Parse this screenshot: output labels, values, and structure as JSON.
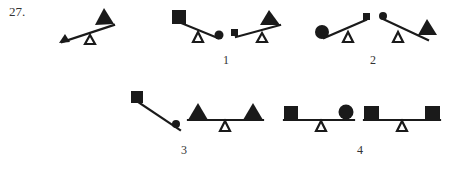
{
  "question": {
    "number": "27.",
    "stem": {
      "description": "Seesaw tilted: small triangle on low left end, large triangle on high right end",
      "left_weight": "small-triangle",
      "right_weight": "large-triangle"
    }
  },
  "options": [
    {
      "label": "1",
      "figures": [
        {
          "left_weight": "large-square",
          "right_weight": "small-circle",
          "tilt": "left-up"
        },
        {
          "left_weight": "small-square",
          "right_weight": "large-triangle",
          "tilt": "right-up"
        }
      ]
    },
    {
      "label": "2",
      "figures": [
        {
          "left_weight": "large-circle",
          "right_weight": "small-square",
          "tilt": "right-up"
        },
        {
          "left_weight": "small-circle",
          "right_weight": "large-triangle",
          "tilt": "left-up"
        }
      ]
    },
    {
      "label": "3",
      "figures": [
        {
          "left_weight": "square",
          "right_weight": "small-circle",
          "tilt": "left-up",
          "fulcrum": "none"
        },
        {
          "left_weight": "large-triangle",
          "right_weight": "large-triangle",
          "tilt": "level"
        }
      ]
    },
    {
      "label": "4",
      "figures": [
        {
          "left_weight": "square",
          "right_weight": "circle",
          "tilt": "level"
        },
        {
          "left_weight": "square",
          "right_weight": "square",
          "tilt": "level"
        }
      ]
    }
  ],
  "colors": {
    "ink": "#1a1a1a",
    "background": "#ffffff",
    "text": "#333333"
  }
}
